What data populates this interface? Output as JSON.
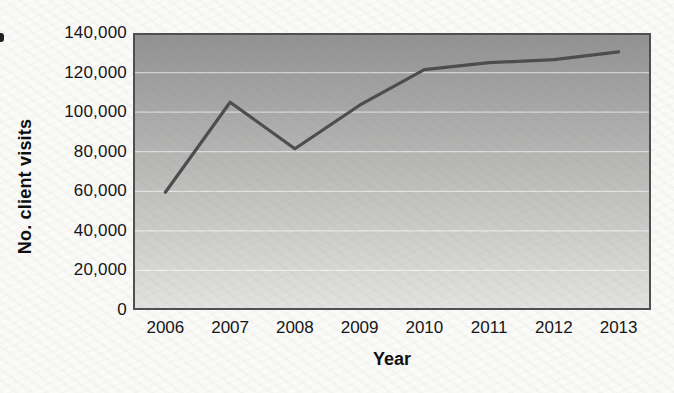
{
  "chart_data": {
    "type": "line",
    "title": "",
    "xlabel": "Year",
    "ylabel": "No. client visits",
    "categories": [
      "2006",
      "2007",
      "2008",
      "2009",
      "2010",
      "2011",
      "2012",
      "2013"
    ],
    "series": [
      {
        "name": "No. client visits",
        "values": [
          59500,
          105000,
          81500,
          103500,
          121500,
          125000,
          126500,
          130500
        ]
      }
    ],
    "ylim": [
      0,
      140000
    ],
    "ytick_step": 20000,
    "yticks": [
      {
        "value": 0,
        "label": "0"
      },
      {
        "value": 20000,
        "label": "20,000"
      },
      {
        "value": 40000,
        "label": "40,000"
      },
      {
        "value": 60000,
        "label": "60,000"
      },
      {
        "value": 80000,
        "label": "80,000"
      },
      {
        "value": 100000,
        "label": "100,000"
      },
      {
        "value": 120000,
        "label": "120,000"
      },
      {
        "value": 140000,
        "label": "140,000"
      }
    ],
    "grid": true,
    "legend_position": "none",
    "markers": false,
    "styles": {
      "line_color": "#4c4c4c",
      "line_width": 3.2,
      "plot_bg_top": "#919191",
      "plot_bg_bottom": "#e3e3e1",
      "gridline_color": "rgba(255,255,255,0.55)",
      "plot_border_color": "#4f4f4f",
      "text_color": "#141414",
      "page_background": "#fafaf8"
    }
  }
}
